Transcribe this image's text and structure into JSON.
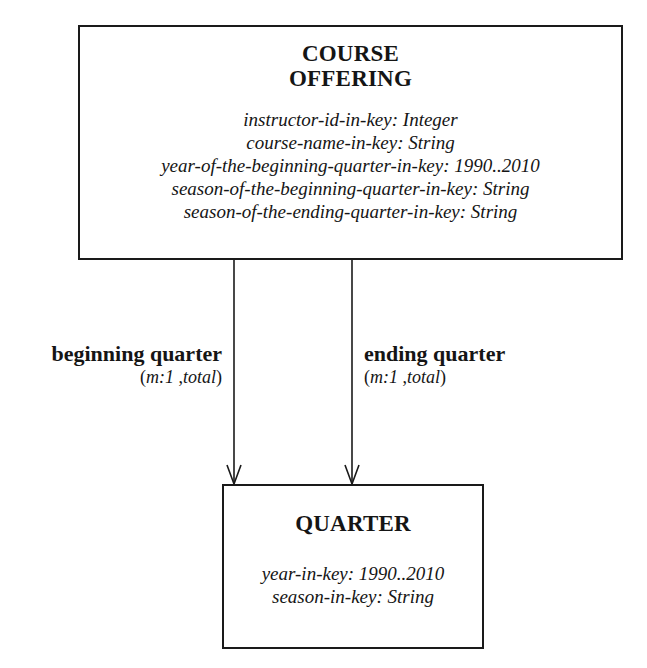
{
  "diagram": {
    "type": "entity-relationship",
    "entities": [
      {
        "id": "course-offering",
        "title_line1": "COURSE",
        "title_line2": "OFFERING",
        "attributes": [
          "instructor-id-in-key: Integer",
          "course-name-in-key: String",
          "year-of-the-beginning-quarter-in-key: 1990..2010",
          "season-of-the-beginning-quarter-in-key: String",
          "season-of-the-ending-quarter-in-key: String"
        ]
      },
      {
        "id": "quarter",
        "title_line1": "QUARTER",
        "attributes": [
          "year-in-key: 1990..2010",
          "season-in-key: String"
        ]
      }
    ],
    "relationships": [
      {
        "name": "beginning quarter",
        "card_open": "(",
        "card_m": "m:1",
        "card_sep": " ,",
        "card_total": "total",
        "card_close": ")",
        "from": "course-offering",
        "to": "quarter"
      },
      {
        "name": "ending quarter",
        "card_open": "(",
        "card_m": "m:1",
        "card_sep": " ,",
        "card_total": "total",
        "card_close": ")",
        "from": "course-offering",
        "to": "quarter"
      }
    ]
  },
  "colors": {
    "line": "#1a1a1a",
    "text": "#151515",
    "background": "#ffffff"
  }
}
